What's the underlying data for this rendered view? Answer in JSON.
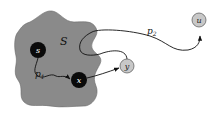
{
  "diagram": {
    "region": {
      "label": "S",
      "fill": "#8a8a8a"
    },
    "nodes": [
      {
        "id": "s",
        "label": "s",
        "fill": "#0a0a0a",
        "text_color": "#ffffff"
      },
      {
        "id": "x",
        "label": "x",
        "fill": "#0a0a0a",
        "text_color": "#ffffff"
      },
      {
        "id": "y",
        "label": "y",
        "fill": "#c8c8c8",
        "text_color": "#222222"
      },
      {
        "id": "u",
        "label": "u",
        "fill": "#c8c8c8",
        "text_color": "#222222"
      }
    ],
    "paths": [
      {
        "id": "p1",
        "label": "p",
        "subscript": "1",
        "from": "s",
        "to": "x"
      },
      {
        "id": "p2",
        "label": "p",
        "subscript": "2",
        "from": "s",
        "to": "u"
      }
    ],
    "edges": [
      {
        "from": "x",
        "to": "y"
      }
    ]
  }
}
